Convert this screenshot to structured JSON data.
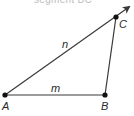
{
  "caption": "segment BC",
  "colors": {
    "stroke": "#3a3a3a",
    "point": "#111111",
    "label": "#2a2a2a"
  },
  "points": {
    "A": {
      "label": "A",
      "x": 5,
      "y": 95
    },
    "B": {
      "label": "B",
      "x": 105,
      "y": 95
    },
    "C": {
      "label": "C",
      "x": 116,
      "y": 17
    }
  },
  "segments": [
    {
      "name": "AB",
      "label": "m"
    },
    {
      "name": "AC",
      "label": "n",
      "extends_as_ray": true
    },
    {
      "name": "BC",
      "label": ""
    }
  ],
  "labels": {
    "A": "A",
    "B": "B",
    "C": "C",
    "m": "m",
    "n": "n"
  }
}
